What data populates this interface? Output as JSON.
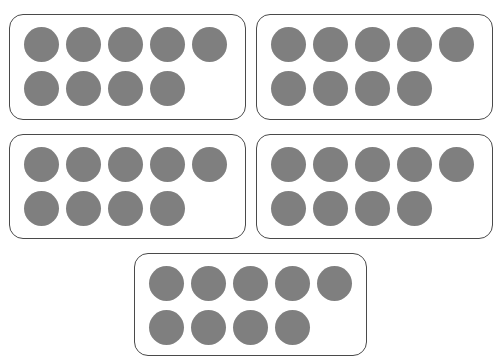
{
  "dot_color": "#7f7f7f",
  "border_color": "#4a4a4a",
  "frames": [
    {
      "id": 1,
      "count": 9,
      "x": 9,
      "y": 14,
      "w": 237,
      "h": 106
    },
    {
      "id": 2,
      "count": 9,
      "x": 256,
      "y": 14,
      "w": 237,
      "h": 106
    },
    {
      "id": 3,
      "count": 9,
      "x": 9,
      "y": 134,
      "w": 237,
      "h": 105
    },
    {
      "id": 4,
      "count": 9,
      "x": 256,
      "y": 134,
      "w": 237,
      "h": 105
    },
    {
      "id": 5,
      "count": 9,
      "x": 134,
      "y": 253,
      "w": 233,
      "h": 103
    }
  ],
  "layout": {
    "dots_per_row": 5,
    "dot_diameter": 35,
    "dot_pitch": 42,
    "first_dot_dx": 15,
    "first_dot_dy": 13,
    "row_gap": 44
  }
}
